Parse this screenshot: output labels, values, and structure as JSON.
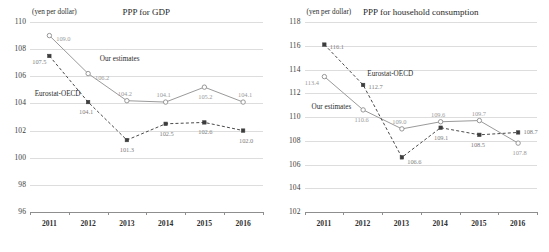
{
  "chart_data": [
    {
      "type": "line",
      "title": "PPP for GDP",
      "unit_label": "(yen per dollar)",
      "xlabel": "",
      "ylabel": "yen per dollar",
      "categories": [
        "2011",
        "2012",
        "2013",
        "2014",
        "2015",
        "2016"
      ],
      "ylim": [
        96,
        110
      ],
      "ytick_step": 2,
      "yticks": [
        "110",
        "108",
        "106",
        "104",
        "102",
        "100",
        "98",
        "96"
      ],
      "grid": true,
      "legend_position": "inline-annotation",
      "series": [
        {
          "name": "Our estimates",
          "style": "solid-open-circle",
          "values": [
            109.0,
            106.2,
            104.2,
            104.1,
            105.2,
            104.1
          ],
          "labels": [
            "109.0",
            "106.2",
            "104.2",
            "104.1",
            "105.2",
            "104.1"
          ]
        },
        {
          "name": "Eurostat-OECD",
          "style": "dashed-filled-square",
          "values": [
            107.5,
            104.1,
            101.3,
            102.5,
            102.6,
            102.0
          ],
          "labels": [
            "107.5",
            "104.1",
            "101.3",
            "102.5",
            "102.6",
            "102.0"
          ]
        }
      ],
      "annotations": [
        {
          "text": "Our estimates",
          "x_frac": 0.3,
          "y_value": 107.6
        },
        {
          "text": "Eurostat-OECD",
          "x_frac": 0.02,
          "y_value": 105.0
        }
      ]
    },
    {
      "type": "line",
      "title": "PPP for household consumption",
      "unit_label": "(yen per dollar)",
      "xlabel": "",
      "ylabel": "yen per dollar",
      "categories": [
        "2011",
        "2012",
        "2013",
        "2014",
        "2015",
        "2016"
      ],
      "ylim": [
        102,
        118
      ],
      "ytick_step": 2,
      "yticks": [
        "118",
        "116",
        "114",
        "112",
        "110",
        "108",
        "106",
        "104",
        "102"
      ],
      "grid": true,
      "legend_position": "inline-annotation",
      "series": [
        {
          "name": "Our estimates",
          "style": "solid-open-circle",
          "values": [
            113.4,
            110.6,
            109.0,
            109.6,
            109.7,
            107.8
          ],
          "labels": [
            "113.4",
            "110.6",
            "109.0",
            "109.6",
            "109.7",
            "107.8"
          ]
        },
        {
          "name": "Eurostat-OECD",
          "style": "dashed-filled-square",
          "values": [
            116.1,
            112.7,
            106.6,
            109.1,
            108.5,
            108.7
          ],
          "labels": [
            "116.1",
            "112.7",
            "106.6",
            "109.1",
            "108.5",
            "108.7"
          ]
        }
      ],
      "annotations": [
        {
          "text": "Eurostat-OECD",
          "x_frac": 0.27,
          "y_value": 114.0
        },
        {
          "text": "Our estimates",
          "x_frac": 0.03,
          "y_value": 111.2
        }
      ]
    }
  ]
}
